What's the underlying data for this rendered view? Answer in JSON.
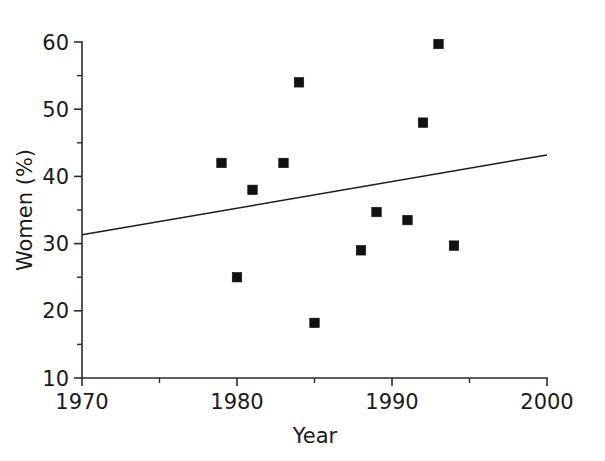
{
  "chart_data": {
    "type": "scatter",
    "title": "",
    "xlabel": "Year",
    "ylabel": "Women (%)",
    "xlim": [
      1970,
      2000
    ],
    "ylim": [
      10,
      60
    ],
    "grid": false,
    "legend": "none",
    "x_ticks_major": [
      1970,
      1980,
      1990,
      2000
    ],
    "x_tick_labels": [
      "1970",
      "1980",
      "1990",
      "2000"
    ],
    "x_ticks_minor": [
      1975,
      1985,
      1995
    ],
    "y_ticks_major": [
      10,
      20,
      30,
      40,
      50,
      60
    ],
    "y_tick_labels": [
      "10",
      "20",
      "30",
      "40",
      "50",
      "60"
    ],
    "y_ticks_minor": [
      15,
      25,
      35,
      45,
      55
    ],
    "marker_style": "filled-square",
    "marker_color": "#111111",
    "points": [
      {
        "x": 1979,
        "y": 42.0
      },
      {
        "x": 1980,
        "y": 25.0
      },
      {
        "x": 1981,
        "y": 38.0
      },
      {
        "x": 1983,
        "y": 42.0
      },
      {
        "x": 1984,
        "y": 54.0
      },
      {
        "x": 1985,
        "y": 18.2
      },
      {
        "x": 1988,
        "y": 29.0
      },
      {
        "x": 1989,
        "y": 34.7
      },
      {
        "x": 1991,
        "y": 33.5
      },
      {
        "x": 1992,
        "y": 48.0
      },
      {
        "x": 1993,
        "y": 59.7
      },
      {
        "x": 1994,
        "y": 29.7
      }
    ],
    "series": [
      {
        "name": "Women (%) by year",
        "type": "scatter",
        "x": [
          1979,
          1980,
          1981,
          1983,
          1984,
          1985,
          1988,
          1989,
          1991,
          1992,
          1993,
          1994
        ],
        "values": [
          42.0,
          25.0,
          38.0,
          42.0,
          54.0,
          18.2,
          29.0,
          34.7,
          33.5,
          48.0,
          59.7,
          29.7
        ]
      },
      {
        "name": "trend line",
        "type": "line",
        "x": [
          1970,
          2000
        ],
        "values": [
          31.3,
          43.2
        ]
      }
    ],
    "trend_line": {
      "x_start": 1970,
      "y_start": 31.3,
      "x_end": 2000,
      "y_end": 43.2,
      "color": "#1c1c1c"
    }
  }
}
